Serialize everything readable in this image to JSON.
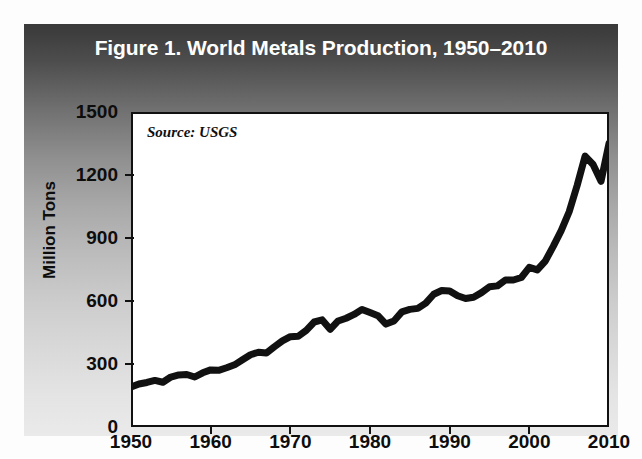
{
  "figure": {
    "title": "Figure 1. World Metals Production, 1950–2010",
    "source_note": "Source: USGS",
    "frame_bg_top": "#393939",
    "frame_bg_bottom": "#eaeaea",
    "plot_bg": "#ffffff",
    "line_color": "#111111",
    "title_color": "#ffffff"
  },
  "chart_data": {
    "type": "line",
    "title": "Figure 1. World Metals Production, 1950–2010",
    "subtitle": "",
    "xlabel": "",
    "ylabel": "Million Tons",
    "annotations": [
      "Source: USGS"
    ],
    "legend": [],
    "legend_position": "none",
    "grid": false,
    "xlim": [
      1950,
      2010
    ],
    "ylim": [
      0,
      1500
    ],
    "xticks": [
      1950,
      1960,
      1970,
      1980,
      1990,
      2000,
      2010
    ],
    "xtick_labels": [
      "1950",
      "1960",
      "1970",
      "1980",
      "1990",
      "2000",
      "2010"
    ],
    "yticks": [
      0,
      300,
      600,
      900,
      1200,
      1500
    ],
    "ytick_labels": [
      "0",
      "300",
      "600",
      "900",
      "1200",
      "1500"
    ],
    "series": [
      {
        "name": "World Metals Production",
        "x": [
          1950,
          1951,
          1952,
          1953,
          1954,
          1955,
          1956,
          1957,
          1958,
          1959,
          1960,
          1961,
          1962,
          1963,
          1964,
          1965,
          1966,
          1967,
          1968,
          1969,
          1970,
          1971,
          1972,
          1973,
          1974,
          1975,
          1976,
          1977,
          1978,
          1979,
          1980,
          1981,
          1982,
          1983,
          1984,
          1985,
          1986,
          1987,
          1988,
          1989,
          1990,
          1991,
          1992,
          1993,
          1994,
          1995,
          1996,
          1997,
          1998,
          1999,
          2000,
          2001,
          2002,
          2003,
          2004,
          2005,
          2006,
          2007,
          2008,
          2009,
          2010
        ],
        "values": [
          190,
          205,
          212,
          222,
          213,
          238,
          248,
          250,
          238,
          258,
          272,
          270,
          282,
          296,
          320,
          344,
          356,
          352,
          382,
          410,
          430,
          432,
          460,
          500,
          510,
          465,
          505,
          518,
          536,
          560,
          545,
          530,
          490,
          505,
          548,
          560,
          565,
          590,
          632,
          650,
          648,
          625,
          612,
          618,
          640,
          668,
          672,
          700,
          700,
          712,
          760,
          748,
          790,
          860,
          935,
          1025,
          1150,
          1290,
          1250,
          1170,
          1350
        ]
      }
    ]
  },
  "axes": {
    "y_title": "Million Tons"
  }
}
